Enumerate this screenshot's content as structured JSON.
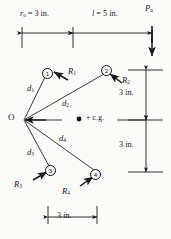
{
  "figure": {
    "type": "bolt-group-eccentric-load-diagram",
    "instant_center_label": "O",
    "cg_label": "+ c.g.",
    "cg_marker": "dot-marker"
  },
  "dimensions": {
    "top_left": {
      "symbol": "r",
      "subscript": "o",
      "text": "= 3 in.",
      "value": 3,
      "unit": "in."
    },
    "top_right": {
      "symbol": "l",
      "text": "= 5 in.",
      "value": 5,
      "unit": "in."
    },
    "right_upper": {
      "text": "3 in.",
      "value": 3,
      "unit": "in."
    },
    "right_lower": {
      "text": "3 in.",
      "value": 3,
      "unit": "in."
    },
    "bottom": {
      "text": "3 in.",
      "value": 3,
      "unit": "in."
    }
  },
  "load": {
    "symbol": "P",
    "subscript": "u",
    "direction": "down"
  },
  "bolts": [
    {
      "id": "1",
      "number": "1",
      "force": "R",
      "force_sub": "1",
      "dist": "d",
      "dist_sub": "1"
    },
    {
      "id": "2",
      "number": "2",
      "force": "R",
      "force_sub": "2",
      "dist": "d",
      "dist_sub": "2"
    },
    {
      "id": "3",
      "number": "3",
      "force": "R",
      "force_sub": "3",
      "dist": "d",
      "dist_sub": "3"
    },
    {
      "id": "4",
      "number": "4",
      "force": "R",
      "force_sub": "4",
      "dist": "d",
      "dist_sub": "4"
    }
  ],
  "colors": {
    "ink": "#1a1a1a",
    "paper": "#fbfbfa",
    "rule": "#333333"
  }
}
